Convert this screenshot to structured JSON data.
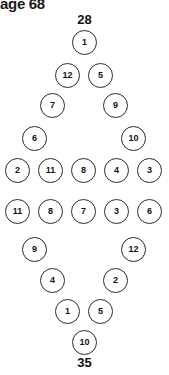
{
  "header": {
    "text": "age 68"
  },
  "diagram": {
    "type": "number-diamond-puzzle",
    "top_sum": "28",
    "bottom_sum": "35",
    "node_count": 26,
    "nodes": [
      {
        "value": "1",
        "x": 72,
        "y": 30
      },
      {
        "value": "12",
        "x": 55,
        "y": 63
      },
      {
        "value": "5",
        "x": 88,
        "y": 63
      },
      {
        "value": "7",
        "x": 40,
        "y": 93
      },
      {
        "value": "9",
        "x": 103,
        "y": 93
      },
      {
        "value": "6",
        "x": 22,
        "y": 126
      },
      {
        "value": "10",
        "x": 121,
        "y": 126
      },
      {
        "value": "2",
        "x": 5,
        "y": 158
      },
      {
        "value": "11",
        "x": 38,
        "y": 158
      },
      {
        "value": "8",
        "x": 71,
        "y": 158
      },
      {
        "value": "4",
        "x": 104,
        "y": 158
      },
      {
        "value": "3",
        "x": 137,
        "y": 158
      },
      {
        "value": "11",
        "x": 5,
        "y": 199
      },
      {
        "value": "8",
        "x": 38,
        "y": 199
      },
      {
        "value": "7",
        "x": 71,
        "y": 199
      },
      {
        "value": "3",
        "x": 104,
        "y": 199
      },
      {
        "value": "6",
        "x": 137,
        "y": 199
      },
      {
        "value": "9",
        "x": 22,
        "y": 237
      },
      {
        "value": "12",
        "x": 121,
        "y": 237
      },
      {
        "value": "4",
        "x": 40,
        "y": 268
      },
      {
        "value": "2",
        "x": 103,
        "y": 268
      },
      {
        "value": "1",
        "x": 55,
        "y": 299
      },
      {
        "value": "5",
        "x": 88,
        "y": 299
      },
      {
        "value": "10",
        "x": 72,
        "y": 330
      }
    ]
  }
}
